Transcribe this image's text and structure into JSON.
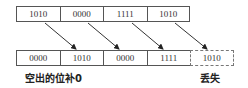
{
  "top_row": {
    "cells": [
      "1010",
      "0000",
      "1111",
      "1010"
    ]
  },
  "bottom_row": {
    "cells": [
      "0000",
      "1010",
      "0000",
      "1111",
      "1010"
    ],
    "dashed_cell_index": 4
  },
  "labels": {
    "fill": "空出的位补0",
    "lost": "丢失"
  },
  "arrows": [
    {
      "from_top_cell": 0,
      "to_bottom_cell": 1
    },
    {
      "from_top_cell": 1,
      "to_bottom_cell": 2
    },
    {
      "from_top_cell": 2,
      "to_bottom_cell": 3
    },
    {
      "from_top_cell": 3,
      "to_bottom_cell": 4
    }
  ]
}
